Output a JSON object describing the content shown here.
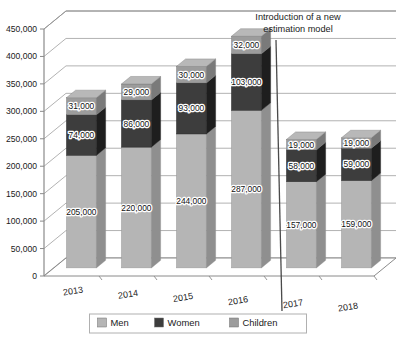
{
  "chart_data": {
    "type": "bar",
    "subtype": "stacked-3d-column",
    "title": "",
    "xlabel": "",
    "ylabel": "",
    "categories": [
      "2013",
      "2014",
      "2015",
      "2016",
      "2017",
      "2018"
    ],
    "series": [
      {
        "name": "Men",
        "values": [
          205000,
          220000,
          244000,
          287000,
          157000,
          159000
        ],
        "color": "#b3b3b3"
      },
      {
        "name": "Women",
        "values": [
          74000,
          86000,
          93000,
          103000,
          58000,
          59000
        ],
        "color": "#3b3b3b"
      },
      {
        "name": "Children",
        "values": [
          31000,
          29000,
          30000,
          32000,
          19000,
          19000
        ],
        "color": "#9a9a9a"
      }
    ],
    "totals": [
      310000,
      335000,
      367000,
      422000,
      234000,
      237000
    ],
    "data_labels": {
      "Men": [
        "205,000",
        "220,000",
        "244,000",
        "287,000",
        "157,000",
        "159,000"
      ],
      "Women": [
        "74,000",
        "86,000",
        "93,000",
        "103,000",
        "58,000",
        "59,000"
      ],
      "Children": [
        "31,000",
        "29,000",
        "30,000",
        "32,000",
        "19,000",
        "19,000"
      ]
    },
    "ylim": [
      0,
      450000
    ],
    "ytick_step": 50000,
    "ytick_labels": [
      "0",
      "50,000",
      "100,000",
      "150,000",
      "200,000",
      "250,000",
      "300,000",
      "350,000",
      "400,000",
      "450,000"
    ],
    "ytick_values": [
      0,
      50000,
      100000,
      150000,
      200000,
      250000,
      300000,
      350000,
      400000,
      450000
    ],
    "grid": true,
    "grid_axis": "y",
    "legend_position": "bottom",
    "legend_entries": [
      "Men",
      "Women",
      "Children"
    ],
    "annotations": [
      {
        "name": "estimation-model-note",
        "line1": "Introduction of a new",
        "line2": "estimation model",
        "divider_after_category": "2016"
      }
    ]
  },
  "colors": {
    "men_front": "#b5b5b5",
    "men_side": "#8f8f8f",
    "men_top": "#cccccc",
    "women_front": "#3d3d3d",
    "women_side": "#1e1e1e",
    "women_top": "#5c5c5c",
    "children_front": "#9c9c9c",
    "children_side": "#7a7a7a",
    "children_top": "#b8b8b8",
    "axis": "#8a8a8a",
    "grid": "#9a9a9a",
    "text": "#1a1a1a",
    "background": "#ffffff",
    "legend_border": "#b0b0b0"
  }
}
